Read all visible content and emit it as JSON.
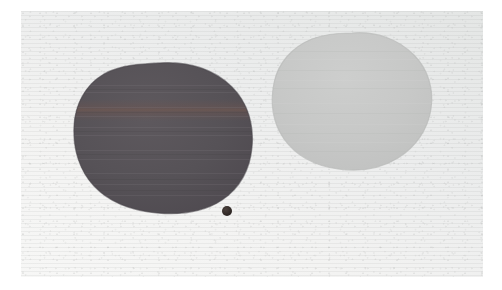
{
  "image": {
    "title": "Two pigment blobs on light grey scanned paper",
    "canvas": {
      "width": 502,
      "height": 290,
      "background_color": "#ffffff"
    },
    "plate": {
      "label": "scanned paper plate",
      "left": 21,
      "top": 11,
      "width": 462,
      "height": 266,
      "base_color": "#eceded",
      "tint_upper_right_color": "#e2e4e3",
      "tint_lower_left_color": "#f6f6f5",
      "texture": "fine paper grain with faint horizontal scan striations"
    },
    "objects": [
      {
        "name": "dark-blob",
        "description": "large irregular rounded dark grey-violet blob, left of centre",
        "bounds": {
          "left": 72,
          "top": 63,
          "right": 250,
          "bottom": 211
        },
        "center": {
          "x": 161,
          "y": 137
        },
        "width": 178,
        "height": 148,
        "fill_color": "#565257",
        "edge_color": "#4b474c",
        "highlight_color": "#6a646a",
        "band_color": "#6b5450",
        "band_y": 111,
        "banding": "subtle horizontal striations; one reddish-brown band near upper third"
      },
      {
        "name": "light-blob",
        "description": "large irregular rounded light grey blob, right of centre",
        "bounds": {
          "left": 272,
          "top": 33,
          "right": 431,
          "bottom": 170
        },
        "center": {
          "x": 351,
          "y": 101
        },
        "width": 159,
        "height": 137,
        "fill_color": "#c7c8c7",
        "edge_color": "#bcbdbc",
        "highlight_color": "#d0d1d0"
      },
      {
        "name": "small-dot",
        "description": "small round near-black speck below and right of the dark blob",
        "center": {
          "x": 227,
          "y": 211
        },
        "diameter": 10,
        "fill_color": "#332b28",
        "edge_color": "#221c1a"
      }
    ]
  }
}
